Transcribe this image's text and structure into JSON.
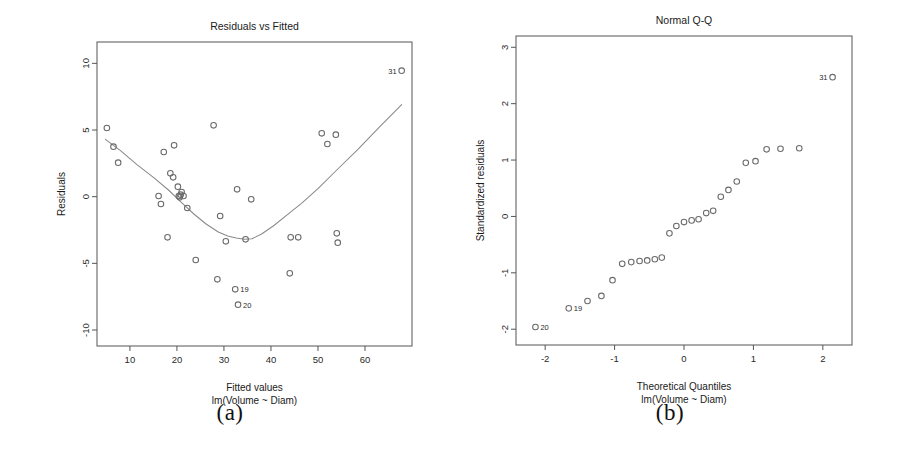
{
  "figure": {
    "background": "#ffffff",
    "marker_color": "#6a6a6a",
    "curve_color": "#8a8a8a",
    "axis_color": "#555555",
    "text_color": "#1a1a1a"
  },
  "panels": [
    {
      "id": "a",
      "caption": "(a)",
      "chart_data": {
        "type": "scatter",
        "title": "Residuals vs Fitted",
        "xlabel": "Fitted values",
        "xlabel_sub": "lm(Volume ~ Diam)",
        "ylabel": "Residuals",
        "xlim": [
          3.0,
          70.0
        ],
        "ylim": [
          -11.2,
          11.6
        ],
        "xticks": [
          10,
          20,
          30,
          40,
          50,
          60
        ],
        "xticklabels": [
          "10",
          "20",
          "30",
          "40",
          "50",
          "60"
        ],
        "yticks": [
          -10,
          -5,
          0,
          5,
          10
        ],
        "yticklabels": [
          "-10",
          "-5",
          "0",
          "5",
          "10"
        ],
        "grid": false,
        "legend": "none",
        "x": [
          5.1,
          6.5,
          7.5,
          16.1,
          16.6,
          17.2,
          18.0,
          18.6,
          19.2,
          19.4,
          20.2,
          20.4,
          20.6,
          20.8,
          21.0,
          21.4,
          22.2,
          24.0,
          27.8,
          28.6,
          29.2,
          30.4,
          32.4,
          32.8,
          33.0,
          34.6,
          35.8,
          44.0,
          44.2,
          45.8,
          50.8,
          52.0,
          53.8,
          54.0,
          54.2,
          67.8
        ],
        "y": [
          5.15,
          3.75,
          2.55,
          0.05,
          -0.55,
          3.35,
          -3.05,
          1.75,
          1.45,
          3.85,
          0.75,
          0.05,
          -0.05,
          0.15,
          0.35,
          0.05,
          -0.85,
          -4.75,
          5.35,
          -6.2,
          -1.45,
          -3.35,
          -6.95,
          0.55,
          -8.1,
          -3.2,
          -0.2,
          -5.75,
          -3.05,
          -3.05,
          4.75,
          3.95,
          4.65,
          -2.75,
          -3.45,
          9.45
        ],
        "labeled_points": [
          {
            "label": "31",
            "x": 67.8,
            "y": 9.45,
            "anchor": "right"
          },
          {
            "label": "19",
            "x": 32.4,
            "y": -6.95,
            "anchor": "left"
          },
          {
            "label": "20",
            "x": 33.0,
            "y": -8.1,
            "anchor": "left"
          }
        ],
        "smooth_line": {
          "name": "lowess",
          "x": [
            4.8,
            8.0,
            11.5,
            15.0,
            18.2,
            21.0,
            23.6,
            26.2,
            28.8,
            30.8,
            32.6,
            34.4,
            36.0,
            38.0,
            40.5,
            43.5,
            46.5,
            50.0,
            54.0,
            58.5,
            63.0,
            67.8
          ],
          "y": [
            4.3,
            3.45,
            2.4,
            1.45,
            0.5,
            -0.45,
            -1.3,
            -2.05,
            -2.65,
            -2.95,
            -3.1,
            -3.2,
            -3.15,
            -2.8,
            -2.2,
            -1.35,
            -0.5,
            0.6,
            2.0,
            3.55,
            5.2,
            6.9
          ]
        }
      }
    },
    {
      "id": "b",
      "caption": "(b)",
      "chart_data": {
        "type": "scatter",
        "title": "Normal Q-Q",
        "xlabel": "Theoretical Quantiles",
        "xlabel_sub": "lm(Volume ~ Diam)",
        "ylabel": "Standardized residuals",
        "xlim": [
          -2.42,
          2.42
        ],
        "ylim": [
          -2.28,
          3.2
        ],
        "xticks": [
          -2,
          -1,
          0,
          1,
          2
        ],
        "xticklabels": [
          "-2",
          "-1",
          "0",
          "1",
          "2"
        ],
        "yticks": [
          -2,
          -1,
          0,
          1,
          2,
          3
        ],
        "yticklabels": [
          "-2",
          "-1",
          "0",
          "1",
          "2",
          "3"
        ],
        "grid": false,
        "legend": "none",
        "x": [
          -2.14,
          -1.66,
          -1.39,
          -1.19,
          -1.03,
          -0.89,
          -0.76,
          -0.64,
          -0.53,
          -0.42,
          -0.32,
          -0.21,
          -0.11,
          0.0,
          0.11,
          0.21,
          0.32,
          0.42,
          0.53,
          0.64,
          0.76,
          0.89,
          1.03,
          1.19,
          1.39,
          1.66
        ],
        "y": [
          -1.96,
          -1.63,
          -1.5,
          -1.41,
          -1.13,
          -0.84,
          -0.81,
          -0.79,
          -0.78,
          -0.76,
          -0.73,
          -0.3,
          -0.17,
          -0.1,
          -0.07,
          -0.05,
          0.06,
          0.1,
          0.35,
          0.47,
          0.62,
          0.95,
          0.98,
          1.19,
          1.2,
          1.21
        ],
        "extra_points": [
          {
            "x": 2.14,
            "y": 2.47,
            "label": "31",
            "anchor": "right"
          }
        ],
        "labeled_points": [
          {
            "label": "31",
            "x": 2.14,
            "y": 2.47,
            "anchor": "right"
          },
          {
            "label": "19",
            "x": -1.66,
            "y": -1.63,
            "anchor": "left"
          },
          {
            "label": "20",
            "x": -2.14,
            "y": -1.96,
            "anchor": "left"
          }
        ]
      }
    }
  ]
}
